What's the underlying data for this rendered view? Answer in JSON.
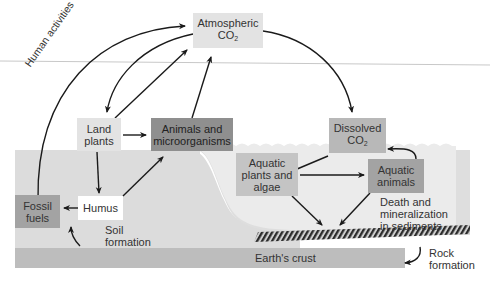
{
  "diagram": {
    "nodes": {
      "atmospheric_co2": {
        "line1": "Atmospheric",
        "line2": "CO",
        "sub": "2"
      },
      "land_plants": {
        "line1": "Land",
        "line2": "plants"
      },
      "animals_microorganisms": {
        "line1": "Animals and",
        "line2": "microorganisms"
      },
      "humus": {
        "line1": "Humus"
      },
      "fossil_fuels": {
        "line1": "Fossil",
        "line2": "fuels"
      },
      "dissolved_co2": {
        "line1": "Dissolved",
        "line2": "CO",
        "sub": "2"
      },
      "aquatic_plants": {
        "line1": "Aquatic",
        "line2": "plants and",
        "line3": "algae"
      },
      "aquatic_animals": {
        "line1": "Aquatic",
        "line2": "animals"
      },
      "earths_crust": {
        "line1": "Earth's crust"
      }
    },
    "labels": {
      "human_activities": "Human activities",
      "soil_formation_1": "Soil",
      "soil_formation_2": "formation",
      "death_1": "Death and",
      "death_2": "mineralization",
      "death_3": "in sediments",
      "rock_1": "Rock",
      "rock_2": "formation"
    },
    "colors": {
      "light_box": "#e3e3e3",
      "mid_box": "#b8b8b8",
      "dark_box": "#8f8f8f",
      "land": "#dcdcdc",
      "water": "#e6e6e6",
      "crust": "#bdbdbd",
      "horizon": "#c8c8c8",
      "arrow": "#1a1a1a"
    }
  }
}
